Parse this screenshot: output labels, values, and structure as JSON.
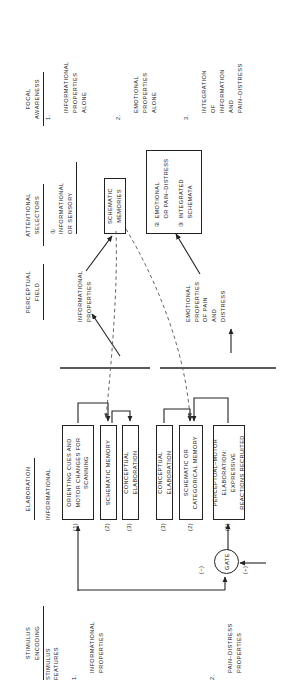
{
  "figure": {
    "orientation": "rotated-90-ccw",
    "columns": [
      {
        "id": "stimulus-encoding",
        "title": "STIMULUS\nENCODING",
        "subtitle": "STIMULUS\nFEATURES"
      },
      {
        "id": "elaboration",
        "title": "ELABORATION",
        "subtitle": "INFORMATIONAL"
      },
      {
        "id": "perceptual-field",
        "title": "PERCEPTUAL\nFIELD",
        "subtitle": ""
      },
      {
        "id": "attentional-selectors",
        "title": "ATTENTIONAL\nSELECTORS",
        "subtitle": ""
      },
      {
        "id": "focal-awareness",
        "title": "FOCAL\nAWARENESS",
        "subtitle": ""
      }
    ],
    "stimulus_features": [
      {
        "num": "1.",
        "label": "INFORMATIONAL\nPROPERTIES"
      },
      {
        "num": "2.",
        "label": "PAIN–DISTRESS\nPROPERTIES"
      }
    ],
    "gate": {
      "label": "GATE",
      "inhibit_sign": "(−)",
      "excite_sign": "(+)"
    },
    "elaboration_boxes": [
      {
        "num": "(1)",
        "label": "ORIENTING CUES AND\nMOTOR CHANGES FOR\nSCANNING"
      },
      {
        "num": "(2)",
        "label": "SCHEMATIC MEMORY"
      },
      {
        "num": "(3)",
        "label": "CONCEPTUAL ELABORATION"
      },
      {
        "num": "(3)",
        "label": "CONCEPTUAL ELABORATION"
      },
      {
        "num": "(2)",
        "label": "SCHEMATIC OR\nCATEGORICAL MEMORY"
      },
      {
        "num": "(1)",
        "label": "PERCEPTUAL–MOTOR\nELABORATION: EXPRESSIVE\nREACTIONS RECRUITED"
      }
    ],
    "perceptual_field": [
      {
        "id": "informational-properties",
        "label": "INFORMATIONAL\nPROPERTIES"
      },
      {
        "id": "emotional-properties",
        "label": "EMOTIONAL\nPROPERTIES\nOF PAIN\nAND\nDISTRESS"
      }
    ],
    "attentional_selectors": {
      "selector_1": {
        "num": "①",
        "label": "INFORMATIONAL\nOR SENSORY"
      },
      "schematic_memories_box": "SCHEMATIC\nMEMORIES",
      "grouped_box": [
        {
          "num": "②",
          "label": "EMOTIONAL\nOR PAIN–DISTRESS"
        },
        {
          "num": "③",
          "label": "INTEGRATED\nSCHEMATA"
        }
      ]
    },
    "focal_awareness": [
      {
        "num": "1.",
        "label": "INFORMATIONAL\nPROPERTIES\nALONE"
      },
      {
        "num": "2.",
        "label": "EMOTIONAL\nPROPERTIES\nALONE"
      },
      {
        "num": "3.",
        "label": "INTEGRATION\nOF\nINFORMATION\nAND\nPAIN–DISTRESS"
      }
    ],
    "colors": {
      "ink": "#1a1a1a",
      "rule": "#222222",
      "paper": "#ffffff"
    }
  }
}
